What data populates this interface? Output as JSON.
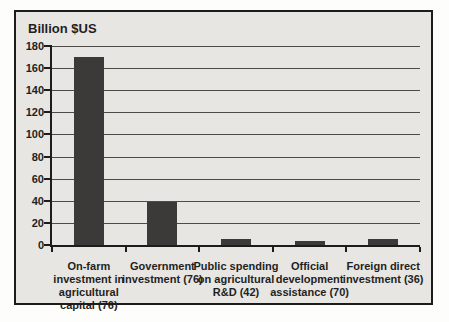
{
  "chart_data": {
    "type": "bar",
    "title": "Billion $US",
    "categories": [
      "On-farm investment in agricultural capital (76)",
      "Government investment (76)",
      "Public spending on agricultural R&D (42)",
      "Official development assistance (70)",
      "Foreign direct investment (36)"
    ],
    "category_lines": [
      [
        "On-farm",
        "investment in",
        "agricultural",
        "capital (76)"
      ],
      [
        "Government",
        "investment (76)"
      ],
      [
        "Public spending",
        "on agricultural",
        "R&D (42)"
      ],
      [
        "Official",
        "development",
        "assistance (70)"
      ],
      [
        "Foreign direct",
        "investment (36)"
      ]
    ],
    "values": [
      170,
      39,
      5,
      4,
      5
    ],
    "xlabel": "",
    "ylabel": "",
    "ylim": [
      0,
      180
    ],
    "yticks": [
      0,
      20,
      40,
      60,
      80,
      100,
      120,
      140,
      160,
      180
    ],
    "grid": "horizontal",
    "legend": "none",
    "colors": {
      "bar": "#3b3a38",
      "plot_background": "#e8e6e2",
      "gridline": "#4d4b48",
      "axis": "#1c1c1c",
      "frame_border": "#1c1c1c",
      "text": "#1f1f1f",
      "page_background": "#fdfdfc"
    }
  }
}
